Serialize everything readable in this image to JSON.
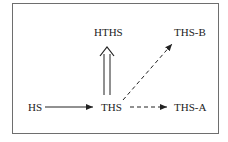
{
  "diagram": {
    "nodes": [
      {
        "id": "HS",
        "label": "HS"
      },
      {
        "id": "THS",
        "label": "THS"
      },
      {
        "id": "HTHS",
        "label": "HTHS"
      },
      {
        "id": "THS-B",
        "label": "THS-B"
      },
      {
        "id": "THS-A",
        "label": "THS-A"
      }
    ],
    "edges": [
      {
        "from": "HS",
        "to": "THS",
        "style": "solid"
      },
      {
        "from": "THS",
        "to": "HTHS",
        "style": "double"
      },
      {
        "from": "THS",
        "to": "THS-B",
        "style": "dashed"
      },
      {
        "from": "THS",
        "to": "THS-A",
        "style": "dashed"
      }
    ],
    "colors": {
      "line": "#222222",
      "frame": "#6e6e6e"
    }
  }
}
